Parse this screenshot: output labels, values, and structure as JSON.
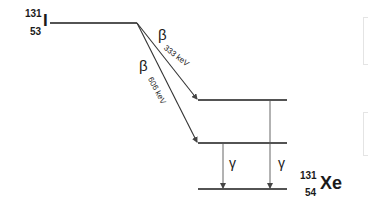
{
  "parent": {
    "mass_number": "131",
    "atomic_number": "53",
    "symbol": "I"
  },
  "daughter": {
    "mass_number": "131",
    "atomic_number": "54",
    "symbol": "Xe"
  },
  "transitions": {
    "beta1": {
      "symbol": "β",
      "energy": "333 keV"
    },
    "beta2": {
      "symbol": "β",
      "energy": "606 keV"
    },
    "gamma1": {
      "symbol": "γ"
    },
    "gamma2": {
      "symbol": "γ"
    }
  },
  "colors": {
    "line": "#1a1a1a",
    "arrow": "#555555",
    "faint_box": "#e4e4e4"
  }
}
